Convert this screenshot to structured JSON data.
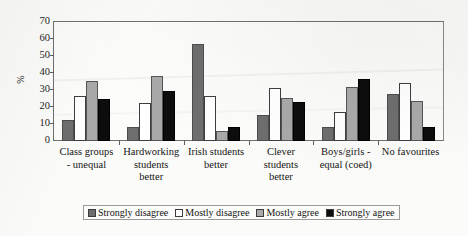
{
  "chart_data": {
    "type": "bar",
    "title": "",
    "subtitle": "",
    "xlabel": "",
    "ylabel": "%",
    "ylim": [
      0,
      70
    ],
    "ytick_labels": [
      "0",
      "10",
      "20",
      "30",
      "40",
      "50",
      "60",
      "70"
    ],
    "ytick_values": [
      0,
      10,
      20,
      30,
      40,
      50,
      60,
      70
    ],
    "grid": false,
    "legend_position": "bottom",
    "categories": [
      "Class groups - unequal",
      "Hardworking students better",
      "Irish students better",
      "Clever students better",
      "Boys/girls - equal (coed)",
      "No favourites"
    ],
    "category_lines": [
      [
        "Class groups",
        "- unequal"
      ],
      [
        "Hardworking",
        "students",
        "better"
      ],
      [
        "Irish students",
        "better"
      ],
      [
        "Clever",
        "students",
        "better"
      ],
      [
        "Boys/girls -",
        "equal (coed)"
      ],
      [
        "No favourites"
      ]
    ],
    "series": [
      {
        "name": "Strongly disagree",
        "color": "#6e6e6e",
        "values": [
          12.5,
          8,
          57,
          15.5,
          8.5,
          27.5
        ]
      },
      {
        "name": "Mostly disagree",
        "color": "#ffffff",
        "values": [
          26.5,
          22.5,
          26.5,
          31,
          17,
          34
        ]
      },
      {
        "name": "Mostly agree",
        "color": "#a9a9a9",
        "values": [
          35.5,
          38.5,
          6,
          25.5,
          32,
          23.5
        ]
      },
      {
        "name": "Strongly agree",
        "color": "#0d0d0d",
        "values": [
          24.5,
          29.5,
          8,
          23,
          36.5,
          8
        ]
      }
    ]
  },
  "legend": {
    "items": [
      {
        "label": "Strongly disagree"
      },
      {
        "label": "Mostly disagree"
      },
      {
        "label": "Mostly agree"
      },
      {
        "label": "Strongly agree"
      }
    ]
  }
}
